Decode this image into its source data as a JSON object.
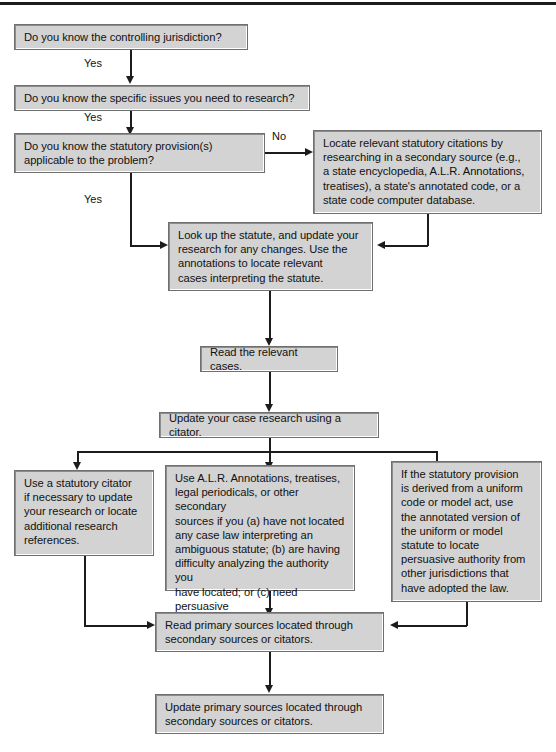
{
  "diagram": {
    "colors": {
      "node_fill": "#d3d3d3",
      "node_border": "#6f6f6f",
      "line": "#1c1c1c",
      "text": "#111111",
      "page_background": "#ffffff"
    },
    "nodes": [
      {
        "id": "q1",
        "text": "Do you know the controlling jurisdiction?"
      },
      {
        "id": "q2",
        "text": "Do you know the specific issues you need to research?"
      },
      {
        "id": "q3",
        "text": "Do you know the statutory provision(s)\napplicable to the problem?"
      },
      {
        "id": "locate",
        "text": "Locate relevant statutory citations by\nresearching in a secondary source (e.g.,\na state encyclopedia, A.L.R. Annotations,\ntreatises), a state's annotated code, or a\nstate code computer database."
      },
      {
        "id": "lookup",
        "text": "Look up the statute, and update your\nresearch for any changes. Use the\nannotations to locate relevant\ncases interpreting the statute."
      },
      {
        "id": "readcases",
        "text": "Read the relevant cases."
      },
      {
        "id": "update",
        "text": "Update your case research using a citator."
      },
      {
        "id": "branch-left",
        "text": "Use a statutory citator\nif necessary to update\nyour research or locate\nadditional research\nreferences."
      },
      {
        "id": "branch-middle",
        "text": "Use A.L.R. Annotations, treatises,\nlegal periodicals, or other secondary\nsources if you (a) have not located\nany case law interpreting an\nambiguous statute; (b) are having\ndifficulty analyzing the authority you\nhave located; or (c) need persuasive\nauthority to support your analysis."
      },
      {
        "id": "branch-right",
        "text": "If the statutory provision\nis derived from a uniform\ncode or model act, use\nthe annotated version of\nthe uniform or model\nstatute to locate\npersuasive authority from\nother jurisdictions that\nhave adopted the law."
      },
      {
        "id": "readprimary",
        "text": "Read primary sources located through\nsecondary sources or citators."
      },
      {
        "id": "updateprimary",
        "text": "Update primary sources located through\nsecondary sources or citators."
      }
    ],
    "edge_labels": {
      "yes1": "Yes",
      "yes2": "Yes",
      "yes3": "Yes",
      "no1": "No"
    }
  }
}
